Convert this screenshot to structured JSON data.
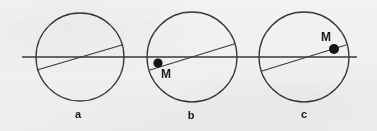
{
  "figure": {
    "background_color": "#f3f2f0",
    "stroke_color": "#3a3a3c",
    "text_color": "#1b1b1d",
    "width": 377,
    "height": 131
  },
  "axis": {
    "name": "horizontal-reference-line",
    "x1": 22,
    "y1": 57,
    "x2": 357,
    "y2": 57,
    "stroke_width": 1.3
  },
  "panels": [
    {
      "id": "a",
      "label": "a",
      "label_x": 78,
      "label_y": 118,
      "circle": {
        "cx": 80,
        "cy": 57,
        "r": 44,
        "stroke_width": 1.3
      },
      "chord": {
        "x1": 37,
        "y1": 70,
        "x2": 122,
        "y2": 45,
        "stroke_width": 1.1
      },
      "marker": null,
      "marker_label": null
    },
    {
      "id": "b",
      "label": "b",
      "label_x": 191,
      "label_y": 119,
      "circle": {
        "cx": 192,
        "cy": 57,
        "r": 45,
        "stroke_width": 1.3
      },
      "chord": {
        "x1": 150,
        "y1": 70,
        "x2": 234,
        "y2": 44,
        "stroke_width": 1.1
      },
      "marker": {
        "cx": 158,
        "cy": 63,
        "r": 4.6
      },
      "marker_label": {
        "text": "M",
        "x": 166,
        "y": 78
      }
    },
    {
      "id": "c",
      "label": "c",
      "label_x": 304,
      "label_y": 118,
      "circle": {
        "cx": 304,
        "cy": 57,
        "r": 45,
        "stroke_width": 1.3
      },
      "chord": {
        "x1": 262,
        "y1": 71,
        "x2": 346,
        "y2": 45,
        "stroke_width": 1.1
      },
      "marker": {
        "cx": 334,
        "cy": 49,
        "r": 5.0
      },
      "marker_label": {
        "text": "M",
        "x": 326,
        "y": 41
      }
    }
  ]
}
